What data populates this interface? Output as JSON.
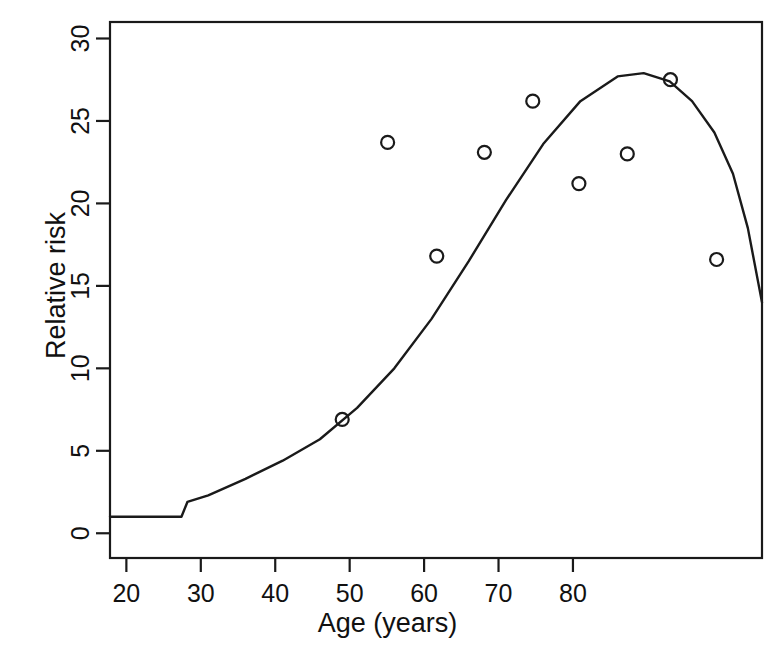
{
  "figure": {
    "background": "#ffffff",
    "ink_color": "#1a1a1a",
    "width": 775,
    "height": 659
  },
  "labels": {
    "x_axis_title": "Age (years)",
    "y_axis_title": "Relative risk"
  },
  "chart_data": {
    "type": "scatter",
    "title": "",
    "subtitle": "",
    "xlabel": "Age (years)",
    "ylabel": "Relative risk",
    "xlim": [
      17.8,
      105.4
    ],
    "ylim": [
      -1.5,
      31.0
    ],
    "xticks": [
      20,
      30,
      40,
      50,
      60,
      70,
      80
    ],
    "yticks": [
      0,
      5,
      10,
      15,
      20,
      25,
      30
    ],
    "xtick_labels": [
      "20",
      "30",
      "40",
      "50",
      "60",
      "70",
      "80"
    ],
    "ytick_labels": [
      "0",
      "5",
      "10",
      "15",
      "20",
      "25",
      "30"
    ],
    "grid": false,
    "legend": null,
    "legend_position": "none",
    "box": true,
    "series": [
      {
        "name": "Observed relative risk",
        "type": "scatter",
        "marker": "open-circle",
        "color": "#1a1a1a",
        "points": [
          {
            "x": 49.0,
            "y": 6.9
          },
          {
            "x": 55.1,
            "y": 23.7
          },
          {
            "x": 61.7,
            "y": 16.8
          },
          {
            "x": 68.1,
            "y": 23.1
          },
          {
            "x": 74.6,
            "y": 26.2
          },
          {
            "x": 80.8,
            "y": 21.2
          },
          {
            "x": 87.3,
            "y": 23.0
          },
          {
            "x": 93.1,
            "y": 27.5
          },
          {
            "x": 99.3,
            "y": 16.6
          }
        ]
      },
      {
        "name": "Fitted model",
        "type": "line",
        "color": "#1a1a1a",
        "points": [
          {
            "x": 17.8,
            "y": 1.0
          },
          {
            "x": 24.5,
            "y": 1.0
          },
          {
            "x": 26.6,
            "y": 1.0
          },
          {
            "x": 27.4,
            "y": 1.0
          },
          {
            "x": 28.2,
            "y": 1.9
          },
          {
            "x": 31.0,
            "y": 2.3
          },
          {
            "x": 36.0,
            "y": 3.3
          },
          {
            "x": 41.0,
            "y": 4.4
          },
          {
            "x": 46.0,
            "y": 5.7
          },
          {
            "x": 51.0,
            "y": 7.6
          },
          {
            "x": 56.0,
            "y": 10.0
          },
          {
            "x": 61.0,
            "y": 13.0
          },
          {
            "x": 66.0,
            "y": 16.5
          },
          {
            "x": 71.0,
            "y": 20.2
          },
          {
            "x": 76.0,
            "y": 23.6
          },
          {
            "x": 81.0,
            "y": 26.2
          },
          {
            "x": 86.0,
            "y": 27.7
          },
          {
            "x": 89.5,
            "y": 27.9
          },
          {
            "x": 93.0,
            "y": 27.4
          },
          {
            "x": 96.0,
            "y": 26.2
          },
          {
            "x": 99.0,
            "y": 24.3
          },
          {
            "x": 101.5,
            "y": 21.8
          },
          {
            "x": 103.5,
            "y": 18.5
          },
          {
            "x": 105.4,
            "y": 14.0
          }
        ]
      }
    ]
  }
}
